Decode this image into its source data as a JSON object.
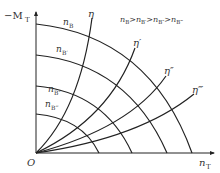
{
  "diagram": {
    "type": "characteristic-map",
    "axes": {
      "y_label": "−M",
      "y_label_sub": "T",
      "x_label": "n",
      "x_label_sub": "T",
      "origin_label": "O"
    },
    "speed_curves": [
      {
        "label": "n",
        "sub": "B"
      },
      {
        "label": "n",
        "sub": "B′"
      },
      {
        "label": "n",
        "sub": "B″"
      },
      {
        "label": "n",
        "sub": "B‴"
      }
    ],
    "efficiency_curves": [
      {
        "label": "η"
      },
      {
        "label": "η′"
      },
      {
        "label": "η″"
      },
      {
        "label": "η‴"
      }
    ],
    "relation": "nB>nB′>nB″>nB‴",
    "relation_parts": [
      "n",
      "B",
      ">",
      "n",
      "B′",
      ">",
      "n",
      "B″",
      ">",
      "n",
      "B‴"
    ],
    "line_color": "#222222"
  }
}
